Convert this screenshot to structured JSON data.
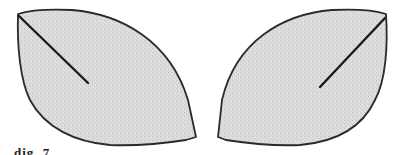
{
  "figure": {
    "colors": {
      "background": "#ffffff",
      "fill": "#d9d9d9",
      "stipple": "#c4c4c4",
      "outline": "#2a2a2a",
      "midrib": "#1a1a1a"
    },
    "shapes": [
      {
        "name": "left-leaf",
        "tip": [
          18,
          14
        ],
        "midrib_end": [
          88,
          83
        ],
        "orientation": "tip-top-left"
      },
      {
        "name": "right-leaf",
        "tip": [
          386,
          14
        ],
        "midrib_end": [
          320,
          87
        ],
        "orientation": "tip-top-right"
      }
    ]
  },
  "caption": {
    "fragment": "dig. 7"
  }
}
